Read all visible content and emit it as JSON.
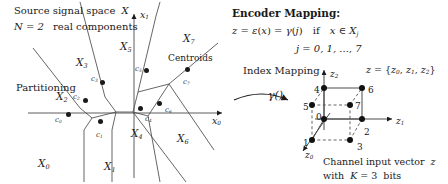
{
  "figure": {
    "title_hidden": "Source signal space partitioning and encoder index mapping to channel input vector",
    "background_color": "#ffffff",
    "ink_color": "#1a1a1a"
  },
  "left_panel": {
    "caption_line1": "Source signal space",
    "caption_line1_symbol": "X",
    "caption_line2_prefix": "N = 2",
    "caption_line2_suffix": "real components",
    "partitioning_label": "Partitioning",
    "centroids_label": "Centroids",
    "axis_x1": "x",
    "axis_x1_sub": "1",
    "axis_x0": "x",
    "axis_x0_sub": "0",
    "region_symbol": "X",
    "regions": [
      {
        "name": "region-X0",
        "sub": "0",
        "x": 38,
        "y": 158
      },
      {
        "name": "region-X1",
        "sub": "1",
        "x": 104,
        "y": 161
      },
      {
        "name": "region-X2",
        "sub": "2",
        "x": 56,
        "y": 91
      },
      {
        "name": "region-X3",
        "sub": "3",
        "x": 76,
        "y": 57
      },
      {
        "name": "region-X4",
        "sub": "4",
        "x": 131,
        "y": 128
      },
      {
        "name": "region-X5",
        "sub": "5",
        "x": 120,
        "y": 41
      },
      {
        "name": "region-X6",
        "sub": "6",
        "x": 177,
        "y": 133
      },
      {
        "name": "region-X7",
        "sub": "7",
        "x": 183,
        "y": 33
      }
    ],
    "centroid_symbol": "c",
    "centroids": [
      {
        "name": "centroid-c0",
        "sub": "0",
        "cx": 68,
        "cy": 114,
        "lx": 55,
        "ly": 117
      },
      {
        "name": "centroid-c1",
        "sub": "1",
        "cx": 100,
        "cy": 121,
        "lx": 96,
        "ly": 132
      },
      {
        "name": "centroid-c2",
        "sub": "2",
        "cx": 85,
        "cy": 100,
        "lx": 73,
        "ly": 94
      },
      {
        "name": "centroid-c3",
        "sub": "3",
        "cx": 102,
        "cy": 82,
        "lx": 91,
        "ly": 76
      },
      {
        "name": "centroid-c4",
        "sub": "4",
        "cx": 140,
        "cy": 108,
        "lx": 145,
        "ly": 116
      },
      {
        "name": "centroid-c5",
        "sub": "5",
        "cx": 146,
        "cy": 70,
        "lx": 135,
        "ly": 66
      },
      {
        "name": "centroid-c6",
        "sub": "6",
        "cx": 159,
        "cy": 103,
        "lx": 165,
        "ly": 107
      },
      {
        "name": "centroid-c7",
        "sub": "7",
        "cx": 187,
        "cy": 69,
        "lx": 183,
        "ly": 79
      }
    ]
  },
  "right_panel": {
    "heading": "Encoder Mapping:",
    "formula_z": "z",
    "formula_eq1": "=",
    "formula_eps": "ε",
    "formula_open": "(",
    "formula_x": "x",
    "formula_close": ")",
    "formula_eq2": "=",
    "formula_gamma": "γ",
    "formula_j": "j",
    "formula_if": "if",
    "formula_in": "∈",
    "formula_Xj": "X",
    "formula_Xj_sub": "j",
    "formula_line": "z = ε(x) = γ(j)   if   x ∈ X",
    "index_line": "j = 0, 1, ..., 7",
    "index_mapping_label": "Index Mapping",
    "gamma_label": "γ()",
    "z_set_label": "z = {z",
    "z_set_full": "z = {z0, z1, z2}",
    "channel_caption_line1": "Channel input vector",
    "channel_caption_line1_sym": "z",
    "channel_caption_line2": "with   K = 3   bits"
  },
  "cube": {
    "axis_z2": "z",
    "axis_z2_sub": "2",
    "axis_z1": "z",
    "axis_z1_sub": "1",
    "axis_z0": "z",
    "axis_z0_sub": "0",
    "nodes": [
      {
        "label": "0",
        "cx": 324,
        "cy": 119,
        "lx": 316,
        "ly": 113,
        "name": "cube-node-0"
      },
      {
        "label": "1",
        "cx": 312,
        "cy": 140,
        "lx": 303,
        "ly": 139,
        "name": "cube-node-1"
      },
      {
        "label": "2",
        "cx": 362,
        "cy": 119,
        "lx": 364,
        "ly": 128,
        "name": "cube-node-2"
      },
      {
        "label": "3",
        "cx": 350,
        "cy": 140,
        "lx": 357,
        "ly": 143,
        "name": "cube-node-3"
      },
      {
        "label": "4",
        "cx": 324,
        "cy": 88,
        "lx": 314,
        "ly": 86,
        "name": "cube-node-4"
      },
      {
        "label": "5",
        "cx": 312,
        "cy": 105,
        "lx": 303,
        "ly": 103,
        "name": "cube-node-5"
      },
      {
        "label": "6",
        "cx": 362,
        "cy": 88,
        "lx": 368,
        "ly": 86,
        "name": "cube-node-6"
      },
      {
        "label": "7",
        "cx": 350,
        "cy": 105,
        "lx": 355,
        "ly": 102,
        "name": "cube-node-7"
      }
    ]
  }
}
